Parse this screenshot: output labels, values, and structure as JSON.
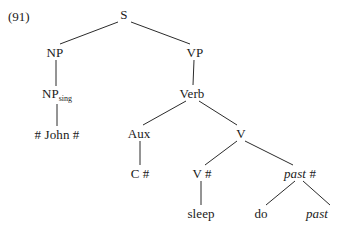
{
  "figure": {
    "example_number": "(91)",
    "type": "syntax-tree",
    "background_color": "#ffffff",
    "line_color": "#2b2b2b",
    "text_color": "#1a1a1a"
  },
  "nodes": [
    {
      "id": "s",
      "label": "S",
      "x": 124,
      "y": 14,
      "italic": false
    },
    {
      "id": "np",
      "label": "NP",
      "x": 55,
      "y": 52,
      "italic": false
    },
    {
      "id": "vp",
      "label": "VP",
      "x": 195,
      "y": 52,
      "italic": false
    },
    {
      "id": "npsing",
      "label": "NP",
      "subscript": "sing",
      "x": 57,
      "y": 95,
      "italic": false
    },
    {
      "id": "john",
      "label": "# John #",
      "x": 57,
      "y": 134,
      "italic": false
    },
    {
      "id": "verb",
      "label": "Verb",
      "x": 192,
      "y": 93,
      "italic": false
    },
    {
      "id": "aux",
      "label": "Aux",
      "x": 139,
      "y": 133,
      "italic": false
    },
    {
      "id": "v_mid",
      "label": "V",
      "x": 241,
      "y": 133,
      "italic": false
    },
    {
      "id": "c_hash",
      "label": "C #",
      "x": 140,
      "y": 173,
      "italic": false
    },
    {
      "id": "v_hash",
      "label": "V #",
      "x": 202,
      "y": 173,
      "italic": false
    },
    {
      "id": "past_hash",
      "label": "past",
      "trailing": " #",
      "x": 300,
      "y": 173,
      "italic": true
    },
    {
      "id": "sleep",
      "label": "sleep",
      "x": 201,
      "y": 213,
      "italic": false
    },
    {
      "id": "do",
      "label": "do",
      "x": 261,
      "y": 213,
      "italic": false
    },
    {
      "id": "past",
      "label": "past",
      "x": 317,
      "y": 213,
      "italic": true
    }
  ],
  "edges": [
    {
      "from": "s",
      "to": "np",
      "x1": 118,
      "y1": 22,
      "x2": 60,
      "y2": 44
    },
    {
      "from": "s",
      "to": "vp",
      "x1": 131,
      "y1": 22,
      "x2": 190,
      "y2": 44
    },
    {
      "from": "np",
      "to": "npsing",
      "x1": 56,
      "y1": 60,
      "x2": 56,
      "y2": 86
    },
    {
      "from": "npsing",
      "to": "john",
      "x1": 57,
      "y1": 104,
      "x2": 57,
      "y2": 126
    },
    {
      "from": "vp",
      "to": "verb",
      "x1": 194,
      "y1": 60,
      "x2": 193,
      "y2": 85
    },
    {
      "from": "verb",
      "to": "aux",
      "x1": 186,
      "y1": 101,
      "x2": 143,
      "y2": 125
    },
    {
      "from": "verb",
      "to": "v_mid",
      "x1": 199,
      "y1": 101,
      "x2": 237,
      "y2": 125
    },
    {
      "from": "aux",
      "to": "c_hash",
      "x1": 140,
      "y1": 141,
      "x2": 140,
      "y2": 165
    },
    {
      "from": "v_mid",
      "to": "v_hash",
      "x1": 237,
      "y1": 141,
      "x2": 205,
      "y2": 165
    },
    {
      "from": "v_mid",
      "to": "past_hash",
      "x1": 245,
      "y1": 141,
      "x2": 293,
      "y2": 165
    },
    {
      "from": "v_hash",
      "to": "sleep",
      "x1": 201,
      "y1": 181,
      "x2": 201,
      "y2": 205
    },
    {
      "from": "past_hash",
      "to": "do",
      "x1": 295,
      "y1": 181,
      "x2": 266,
      "y2": 205
    },
    {
      "from": "past_hash",
      "to": "past",
      "x1": 303,
      "y1": 181,
      "x2": 330,
      "y2": 205
    }
  ]
}
